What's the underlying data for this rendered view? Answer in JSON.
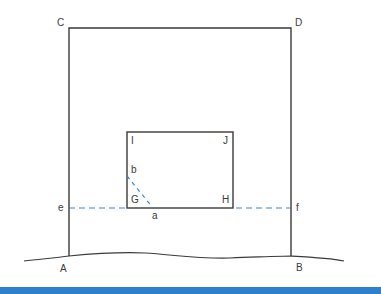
{
  "diagram": {
    "type": "geometric-construction",
    "colors": {
      "line": "#3a3a3a",
      "dashed": "#3f86c8",
      "bottom_bar": "#2f7fcf"
    },
    "labels": {
      "A": "A",
      "B": "B",
      "C": "C",
      "D": "D",
      "I": "I",
      "J": "J",
      "G": "G",
      "H": "H",
      "a": "a",
      "b": "b",
      "e": "e",
      "f": "f"
    },
    "shapes": {
      "outer_frame": "C-D top edge with verticals down to A and B at ground line",
      "inner_rect": "I-J-H-G rectangle",
      "dashed_horizontal": "e to f through G-H level",
      "dashed_diagonal": "b to a"
    }
  }
}
